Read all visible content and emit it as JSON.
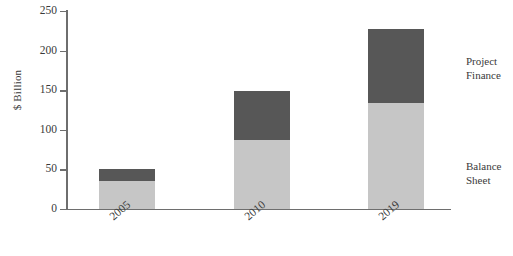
{
  "chart_data": {
    "type": "bar",
    "stacked": true,
    "title": "",
    "subtitle": "",
    "xlabel": "",
    "ylabel": "$ Billion",
    "categories": [
      "2005",
      "2010",
      "2019"
    ],
    "series": [
      {
        "name": "Balance Sheet",
        "values": [
          35,
          87,
          134
        ],
        "color": "#c6c6c6"
      },
      {
        "name": "Project Finance",
        "values": [
          15,
          62,
          93
        ],
        "color": "#575757"
      }
    ],
    "totals": [
      50,
      149,
      227
    ],
    "ylim": [
      0,
      250
    ],
    "ytick_values": [
      0,
      50,
      100,
      150,
      200,
      250
    ],
    "ytick_labels": [
      "0",
      "50",
      "100",
      "150",
      "200",
      "250"
    ],
    "grid": false,
    "legend_position": "right-inline",
    "annotations": [
      {
        "text": "Project Finance",
        "target_series": "Project Finance"
      },
      {
        "text": "Balance Sheet",
        "target_series": "Balance Sheet"
      }
    ]
  },
  "legend": {
    "project_line1": "Project",
    "project_line2": "Finance",
    "balance_line1": "Balance",
    "balance_line2": "Sheet"
  },
  "colors": {
    "balance_sheet": "#c6c6c6",
    "project_finance": "#575757",
    "axis": "#6e6e6e",
    "text": "#3a3a3a",
    "background": "#ffffff"
  }
}
